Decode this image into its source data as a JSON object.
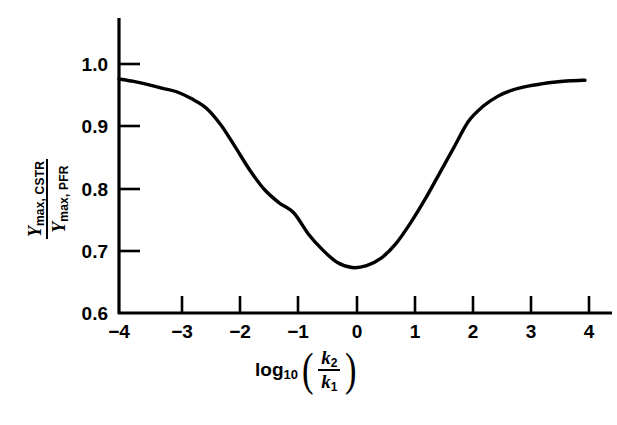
{
  "chart_data": {
    "type": "line",
    "title": "",
    "xlabel": "log10(k2/k1)",
    "ylabel": "Ymax,CSTR / Ymax,PFR",
    "xlim": [
      -4,
      4
    ],
    "ylim": [
      0.6,
      1.05
    ],
    "grid": false,
    "legend": null,
    "x_tick_labels": [
      "−4",
      "−3",
      "−2",
      "−1",
      "0",
      "1",
      "2",
      "3",
      "4"
    ],
    "x_ticks": [
      -4,
      -3,
      -2,
      -1,
      0,
      1,
      2,
      3,
      4
    ],
    "y_tick_labels": [
      "0.6",
      "0.7",
      "0.8",
      "0.9",
      "1.0"
    ],
    "y_ticks": [
      0.6,
      0.7,
      0.8,
      0.9,
      1.0
    ],
    "series": [
      {
        "name": "Ymax,CSTR / Ymax,PFR",
        "color": "#000000",
        "linewidth": 3.4,
        "x": [
          -4.0,
          -3.75,
          -3.5,
          -3.25,
          -3.0,
          -2.75,
          -2.5,
          -2.25,
          -2.0,
          -1.75,
          -1.5,
          -1.25,
          -1.0,
          -0.75,
          -0.5,
          -0.25,
          0.0,
          0.25,
          0.5,
          0.75,
          1.0,
          1.25,
          1.5,
          1.75,
          2.0,
          2.25,
          2.5,
          2.75,
          3.0,
          3.25,
          3.5,
          3.75,
          4.0
        ],
        "y": [
          0.976,
          0.972,
          0.967,
          0.961,
          0.955,
          0.944,
          0.929,
          0.902,
          0.866,
          0.829,
          0.798,
          0.777,
          0.761,
          0.727,
          0.701,
          0.681,
          0.673,
          0.676,
          0.688,
          0.711,
          0.744,
          0.782,
          0.824,
          0.866,
          0.908,
          0.932,
          0.948,
          0.958,
          0.964,
          0.968,
          0.971,
          0.973,
          0.974
        ]
      }
    ],
    "annotations": {
      "minimum_x": 0,
      "minimum_y": 0.673,
      "left_endpoint_y": 0.976,
      "right_endpoint_y": 0.974
    },
    "xlabel_parts": {
      "log": "log",
      "log_sub": "10",
      "numerator": "k",
      "numerator_sub": "2",
      "denominator": "k",
      "denominator_sub": "1",
      "open_paren": "(",
      "close_paren": ")"
    },
    "ylabel_parts": {
      "numerator": "Y",
      "numerator_sub": "max, CSTR",
      "denominator": "Y",
      "denominator_sub": "max, PFR"
    },
    "axis_color": "#000000",
    "background": "#ffffff"
  }
}
